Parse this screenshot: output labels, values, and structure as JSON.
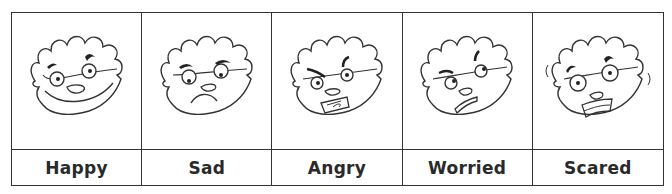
{
  "emotions": [
    {
      "label": "Happy",
      "expression": "happy-face"
    },
    {
      "label": "Sad",
      "expression": "sad-face"
    },
    {
      "label": "Angry",
      "expression": "angry-face"
    },
    {
      "label": "Worried",
      "expression": "worried-face"
    },
    {
      "label": "Scared",
      "expression": "scared-face"
    }
  ],
  "colors": {
    "line": "#333333",
    "background": "#ffffff"
  }
}
